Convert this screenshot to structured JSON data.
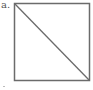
{
  "figure": {
    "label": "a.",
    "shape": "square-with-diagonal",
    "diagonal": "top-left-to-bottom-right",
    "stroke_color": "#6b6b6b",
    "background": "#ffffff"
  }
}
